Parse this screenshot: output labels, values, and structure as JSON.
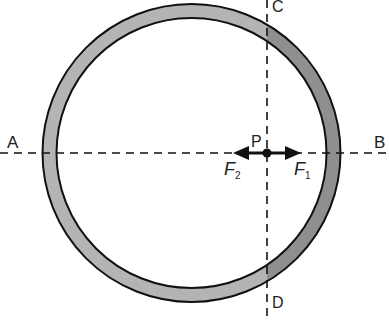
{
  "diagram": {
    "colors": {
      "ring_fill_left": "#b4b4b4",
      "ring_fill_right": "#8f8f8f",
      "stroke": "#111111",
      "background": "#ffffff"
    },
    "ring": {
      "cx": 191.5,
      "cy": 153,
      "outer_r": 149,
      "inner_r": 135
    },
    "point": {
      "label": "P",
      "x": 267,
      "y": 153
    },
    "lines": [
      {
        "name": "AB",
        "start_label": "A",
        "end_label": "B",
        "orientation": "horizontal"
      },
      {
        "name": "CD",
        "start_label": "C",
        "end_label": "D",
        "orientation": "vertical"
      }
    ],
    "forces": [
      {
        "symbol": "F",
        "subscript": "1",
        "direction": "right"
      },
      {
        "symbol": "F",
        "subscript": "2",
        "direction": "left"
      }
    ],
    "labels": {
      "A": "A",
      "B": "B",
      "C": "C",
      "D": "D",
      "P": "P",
      "F1_main": "F",
      "F1_sub": "1",
      "F2_main": "F",
      "F2_sub": "2"
    }
  }
}
